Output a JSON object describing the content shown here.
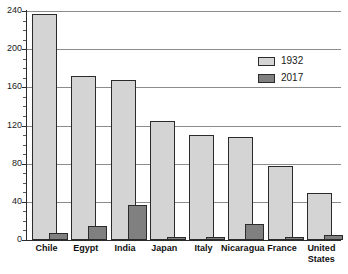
{
  "chart_data": {
    "type": "bar",
    "title": "",
    "xlabel": "",
    "ylabel": "",
    "ylim": [
      0,
      240
    ],
    "ytick_step": 40,
    "yticks": [
      0,
      40,
      80,
      120,
      160,
      200,
      240
    ],
    "grid": true,
    "legend_position": "top-right",
    "categories": [
      "Chile",
      "Egypt",
      "India",
      "Japan",
      "Italy",
      "Nicaragua",
      "France",
      "United States"
    ],
    "series": [
      {
        "name": "1932",
        "color": "#d4d4d4",
        "values": [
          237,
          172,
          168,
          125,
          110,
          108,
          78,
          49
        ]
      },
      {
        "name": "2017",
        "color": "#808080",
        "values": [
          7,
          15,
          37,
          3,
          3,
          17,
          3,
          5
        ]
      }
    ]
  },
  "legend": {
    "entries": [
      {
        "label": "1932",
        "swatch": "light"
      },
      {
        "label": "2017",
        "swatch": "dark"
      }
    ]
  }
}
